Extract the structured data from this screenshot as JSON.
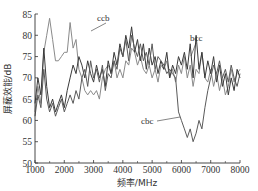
{
  "chart_data": {
    "type": "line",
    "title": "",
    "xlabel": "频率/MHz",
    "ylabel": "屏蔽效能/dB",
    "xlim": [
      1000,
      8000
    ],
    "ylim": [
      50,
      85
    ],
    "xticks": [
      1000,
      2000,
      3000,
      4000,
      5000,
      6000,
      7000,
      8000
    ],
    "yticks": [
      50,
      55,
      60,
      65,
      70,
      75,
      80,
      85
    ],
    "grid": false,
    "legend": "inline annotations",
    "annotations": [
      {
        "text": "ccb",
        "x": 2900,
        "y": 82.5,
        "points_to": [
          2500,
          78.5
        ]
      },
      {
        "text": "bcc",
        "x": 6450,
        "y": 77.5,
        "points_to": [
          6150,
          73
        ]
      },
      {
        "text": "cbc",
        "x": 4700,
        "y": 59,
        "points_to": [
          5850,
          60.5
        ]
      }
    ],
    "series": [
      {
        "name": "ccb",
        "color": "#8a8a8a",
        "x": [
          1000,
          1100,
          1200,
          1300,
          1400,
          1500,
          1600,
          1700,
          1800,
          1900,
          2000,
          2100,
          2200,
          2300,
          2400,
          2500,
          2600,
          2700,
          2800,
          2900,
          3000,
          3100,
          3200,
          3300,
          3400,
          3500,
          3600,
          3700,
          3800,
          3900,
          4000,
          4100,
          4200,
          4300,
          4400,
          4500,
          4600,
          4700,
          4800,
          4900,
          5000,
          5100,
          5200,
          5300,
          5400,
          5500,
          5600,
          5700,
          5800,
          5900,
          6000,
          6100,
          6200,
          6300,
          6400,
          6500,
          6600,
          6700,
          6800,
          6900,
          7000,
          7100,
          7200,
          7300,
          7400,
          7500,
          7600,
          7700,
          7800,
          7900,
          8000
        ],
        "values": [
          62,
          68,
          64,
          76,
          80,
          84,
          79,
          74,
          74,
          75,
          76,
          76,
          83,
          77,
          79,
          72,
          70,
          67,
          66,
          67,
          66,
          67,
          65,
          70,
          72,
          73,
          71,
          74,
          70,
          72,
          70,
          74,
          73,
          77,
          76,
          73,
          75,
          72,
          71,
          73,
          70,
          72,
          69,
          73,
          72,
          74,
          70,
          72,
          69,
          73,
          71,
          75,
          70,
          73,
          68,
          72,
          71,
          76,
          70,
          69,
          72,
          68,
          71,
          67,
          70,
          66,
          68,
          72,
          69,
          71,
          72
        ],
        "ylabel_note": "light gray line, peaks near 84 at 1600 MHz"
      },
      {
        "name": "bcc",
        "color": "#3a3a3a",
        "x": [
          1000,
          1100,
          1200,
          1300,
          1400,
          1500,
          1600,
          1700,
          1800,
          1900,
          2000,
          2100,
          2200,
          2300,
          2400,
          2500,
          2600,
          2700,
          2800,
          2900,
          3000,
          3100,
          3200,
          3300,
          3400,
          3500,
          3600,
          3700,
          3800,
          3900,
          4000,
          4100,
          4200,
          4300,
          4400,
          4500,
          4600,
          4700,
          4800,
          4900,
          5000,
          5100,
          5200,
          5300,
          5400,
          5500,
          5600,
          5700,
          5800,
          5900,
          6000,
          6100,
          6200,
          6300,
          6400,
          6500,
          6600,
          6700,
          6800,
          6900,
          7000,
          7100,
          7200,
          7300,
          7400,
          7500,
          7600,
          7700,
          7800,
          7900,
          8000
        ],
        "values": [
          64,
          70,
          66,
          77,
          68,
          63,
          65,
          62,
          64,
          66,
          63,
          67,
          70,
          73,
          71,
          75,
          73,
          70,
          74,
          71,
          69,
          73,
          70,
          72,
          68,
          74,
          71,
          76,
          73,
          78,
          75,
          80,
          77,
          82,
          76,
          79,
          74,
          78,
          72,
          77,
          73,
          75,
          71,
          74,
          72,
          76,
          70,
          73,
          71,
          75,
          73,
          76,
          72,
          78,
          70,
          80,
          72,
          76,
          70,
          74,
          71,
          75,
          69,
          73,
          68,
          71,
          66,
          70,
          67,
          72,
          70
        ]
      },
      {
        "name": "cbc",
        "color": "#5a5a5a",
        "x": [
          1000,
          1100,
          1200,
          1300,
          1400,
          1500,
          1600,
          1700,
          1800,
          1900,
          2000,
          2100,
          2200,
          2300,
          2400,
          2500,
          2600,
          2700,
          2800,
          2900,
          3000,
          3100,
          3200,
          3300,
          3400,
          3500,
          3600,
          3700,
          3800,
          3900,
          4000,
          4100,
          4200,
          4300,
          4400,
          4500,
          4600,
          4700,
          4800,
          4900,
          5000,
          5100,
          5200,
          5300,
          5400,
          5500,
          5600,
          5700,
          5800,
          5900,
          6000,
          6100,
          6200,
          6300,
          6400,
          6500,
          6600,
          6700,
          6800,
          6900,
          7000,
          7100,
          7200,
          7300,
          7400,
          7500,
          7600,
          7700,
          7800,
          7900,
          8000
        ],
        "values": [
          61,
          66,
          63,
          72,
          65,
          62,
          64,
          61,
          63,
          65,
          62,
          64,
          66,
          64,
          67,
          65,
          70,
          72,
          68,
          74,
          70,
          72,
          69,
          73,
          67,
          71,
          70,
          74,
          72,
          77,
          75,
          79,
          74,
          80,
          77,
          75,
          78,
          74,
          76,
          73,
          78,
          72,
          75,
          74,
          73,
          71,
          72,
          71,
          70,
          62,
          60,
          58,
          56,
          58,
          55,
          57,
          60,
          58,
          63,
          67,
          70,
          73,
          71,
          74,
          70,
          72,
          69,
          73,
          70,
          68,
          71
        ]
      }
    ]
  },
  "axes": {
    "x_title": "频率/MHz",
    "y_title": "屏蔽效能/dB",
    "x_ticks": [
      "1000",
      "2000",
      "3000",
      "4000",
      "5000",
      "6000",
      "7000",
      "8000"
    ],
    "y_ticks": [
      "50",
      "55",
      "60",
      "65",
      "70",
      "75",
      "80",
      "85"
    ]
  },
  "labels": {
    "ccb": "ccb",
    "bcc": "bcc",
    "cbc": "cbc"
  }
}
